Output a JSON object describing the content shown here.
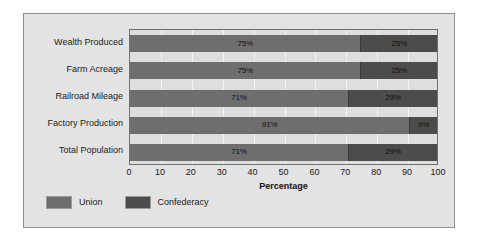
{
  "chart_data": {
    "type": "bar",
    "orientation": "horizontal",
    "stacked": true,
    "title": "",
    "xlabel": "Percentage",
    "ylabel": "",
    "xlim": [
      0,
      100
    ],
    "xticks": [
      0,
      10,
      20,
      30,
      40,
      50,
      60,
      70,
      80,
      90,
      100
    ],
    "grid": true,
    "legend_position": "bottom-left",
    "categories": [
      "Wealth Produced",
      "Farm Acreage",
      "Railroad Mileage",
      "Factory Production",
      "Total Population"
    ],
    "series": [
      {
        "name": "Union",
        "color": "#6e6e6e",
        "values": [
          75,
          75,
          71,
          91,
          71
        ],
        "labels": [
          "75%",
          "75%",
          "71%",
          "91%",
          "71%"
        ]
      },
      {
        "name": "Confederacy",
        "color": "#4c4c4c",
        "values": [
          25,
          25,
          29,
          9,
          29
        ],
        "labels": [
          "25%",
          "25%",
          "29%",
          "9%",
          "29%"
        ]
      }
    ]
  },
  "colors": {
    "page_background": "#ffffff",
    "frame_background": "#e3e3e3",
    "frame_border": "#8e8e8e",
    "plot_background": "#dedede",
    "plot_border": "#6f6f6f",
    "gridline": "#f2f2f2",
    "union": "#6e6e6e",
    "confederacy": "#4c4c4c",
    "text": "#1a1a1a"
  }
}
